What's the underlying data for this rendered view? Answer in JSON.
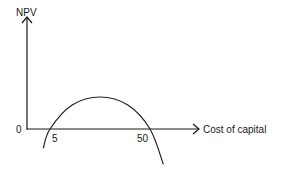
{
  "chart_data": {
    "type": "line",
    "title": "",
    "ylabel": "NPV",
    "xlabel": "Cost of capital",
    "origin_label": "0",
    "x_tick_labels": [
      "5",
      "50"
    ],
    "x_roots": [
      5,
      50
    ],
    "series": [
      {
        "name": "NPV profile",
        "description": "Inverted-U NPV curve, negative below 5 and above 50, positive between",
        "points": [
          {
            "x": 2,
            "y": -0.6
          },
          {
            "x": 5,
            "y": 0
          },
          {
            "x": 15,
            "y": 0.75
          },
          {
            "x": 27.5,
            "y": 1
          },
          {
            "x": 40,
            "y": 0.75
          },
          {
            "x": 50,
            "y": 0
          },
          {
            "x": 56,
            "y": -1.1
          }
        ]
      }
    ],
    "grid": false,
    "legend": "none"
  },
  "colors": {
    "ink": "#1a1a1a",
    "background": "#ffffff"
  }
}
